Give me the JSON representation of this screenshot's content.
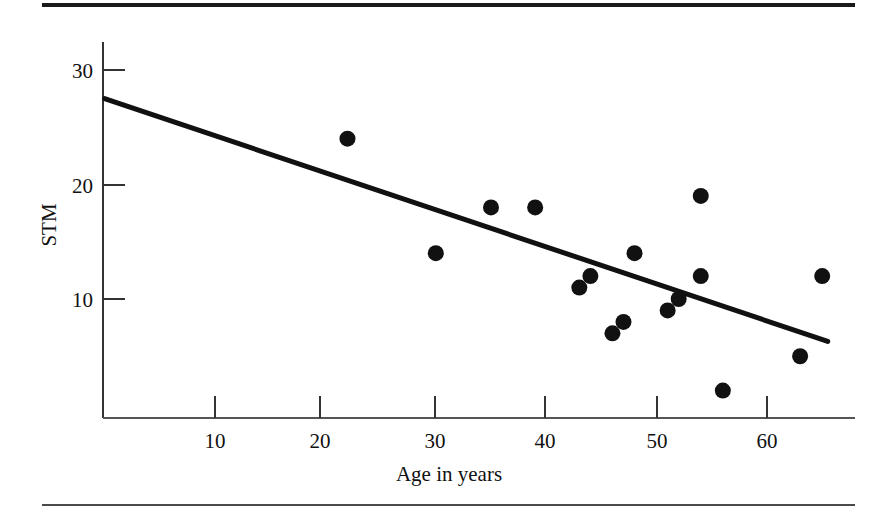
{
  "figure": {
    "background_color": "#ffffff",
    "ink_color": "#111111",
    "rule_top_color": "#1a1a1a",
    "rule_bottom_color": "#4a4a4a"
  },
  "chart_data": {
    "type": "scatter",
    "title": "",
    "xlabel": "Age in years",
    "ylabel": "STM",
    "xlim": [
      0,
      68
    ],
    "ylim": [
      0,
      32
    ],
    "xticks": [
      10,
      20,
      30,
      40,
      50,
      60
    ],
    "yticks": [
      10,
      20,
      30
    ],
    "xtick_labels": [
      "10",
      "20",
      "30",
      "40",
      "50",
      "60"
    ],
    "ytick_labels": [
      "10",
      "20",
      "30"
    ],
    "grid": false,
    "legend": false,
    "marker": "filled-circle",
    "marker_color": "#111111",
    "points": [
      {
        "x": 22,
        "y": 24
      },
      {
        "x": 30,
        "y": 14
      },
      {
        "x": 35,
        "y": 18
      },
      {
        "x": 39,
        "y": 18
      },
      {
        "x": 43,
        "y": 11
      },
      {
        "x": 44,
        "y": 12
      },
      {
        "x": 46,
        "y": 7
      },
      {
        "x": 47,
        "y": 8
      },
      {
        "x": 48,
        "y": 14
      },
      {
        "x": 51,
        "y": 9
      },
      {
        "x": 52,
        "y": 10
      },
      {
        "x": 54,
        "y": 19
      },
      {
        "x": 54,
        "y": 12
      },
      {
        "x": 56,
        "y": 2
      },
      {
        "x": 63,
        "y": 5
      },
      {
        "x": 65,
        "y": 12
      }
    ],
    "regression_line": {
      "label": "",
      "color": "#111111",
      "x_start": 0,
      "y_start": 27.5,
      "x_end": 65.5,
      "y_end": 6.3
    }
  }
}
